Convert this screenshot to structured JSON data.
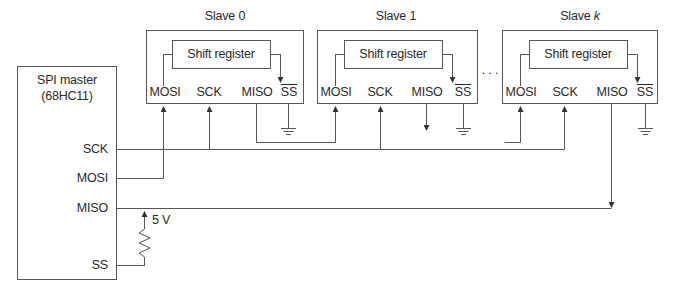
{
  "diagram": {
    "type": "SPI bus daisy-chain connection",
    "master": {
      "title": "SPI master",
      "subtitle": "(68HC11)",
      "pins": {
        "sck": "SCK",
        "mosi": "MOSI",
        "miso": "MISO",
        "ss": "SS"
      },
      "pullup_label": "5 V"
    },
    "slaves": [
      {
        "title_prefix": "Slave ",
        "title_index": "0",
        "shift_register": "Shift register",
        "pins": {
          "mosi": "MOSI",
          "sck": "SCK",
          "miso": "MISO",
          "ss": "SS"
        }
      },
      {
        "title_prefix": "Slave ",
        "title_index": "1",
        "shift_register": "Shift register",
        "pins": {
          "mosi": "MOSI",
          "sck": "SCK",
          "miso": "MISO",
          "ss": "SS"
        }
      },
      {
        "title_prefix": "Slave ",
        "title_index": "k",
        "shift_register": "Shift register",
        "pins": {
          "mosi": "MOSI",
          "sck": "SCK",
          "miso": "MISO",
          "ss": "SS"
        }
      }
    ],
    "ellipsis": ". . .",
    "colors": {
      "line": "#555555",
      "text": "#2a2a2a",
      "background": "#ffffff"
    }
  }
}
